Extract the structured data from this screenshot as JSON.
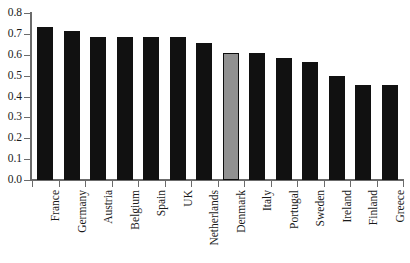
{
  "chart_data": {
    "type": "bar",
    "title": "",
    "subtitle": "",
    "xlabel": "",
    "ylabel": "",
    "ylim": [
      0.0,
      0.8
    ],
    "xlim_note": "14 country categories, ticks at category boundaries",
    "grid": false,
    "legend": "none",
    "orientation": "vertical",
    "x_tick_label_rotation": -90,
    "ytick_labels": [
      "0.0",
      "0.1",
      "0.2",
      "0.3",
      "0.4",
      "0.5",
      "0.6",
      "0.7",
      "0.8"
    ],
    "ytick_values": [
      0.0,
      0.1,
      0.2,
      0.3,
      0.4,
      0.5,
      0.6,
      0.7,
      0.8
    ],
    "categories": [
      "France",
      "Germany",
      "Austria",
      "Belgium",
      "Spain",
      "UK",
      "Netherlands",
      "Denmark",
      "Italy",
      "Portugal",
      "Sweden",
      "Ireland",
      "Finland",
      "Greece"
    ],
    "values": [
      0.735,
      0.715,
      0.685,
      0.685,
      0.685,
      0.685,
      0.655,
      0.61,
      0.61,
      0.585,
      0.565,
      0.5,
      0.455,
      0.455
    ],
    "highlighted_category": "Denmark",
    "colors": {
      "bar": "#111111",
      "highlight_bar": "#919191",
      "highlight_border": "#0d0d0d",
      "axis": "#6b6b6b",
      "text": "#1a1a1a",
      "background": "#ffffff"
    }
  }
}
